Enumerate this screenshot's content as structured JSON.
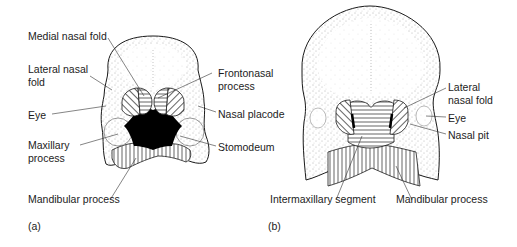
{
  "figure": {
    "panels": [
      {
        "id": "a",
        "tag": "(a)",
        "labels": {
          "medial_nasal_fold": "Medial nasal fold",
          "lateral_nasal_fold_line1": "Lateral nasal",
          "lateral_nasal_fold_line2": "fold",
          "eye": "Eye",
          "maxillary_process_line1": "Maxillary",
          "maxillary_process_line2": "process",
          "mandibular_process": "Mandibular process",
          "frontonasal_process_line1": "Frontonasal",
          "frontonasal_process_line2": "process",
          "nasal_placode": "Nasal placode",
          "stomodeum": "Stomodeum"
        }
      },
      {
        "id": "b",
        "tag": "(b)",
        "labels": {
          "lateral_nasal_fold_line1": "Lateral",
          "lateral_nasal_fold_line2": "nasal fold",
          "eye": "Eye",
          "nasal_pit": "Nasal pit",
          "intermaxillary_segment": "Intermaxillary segment",
          "mandibular_process": "Mandibular process"
        }
      }
    ],
    "colors": {
      "ink": "#1a1a1a",
      "stipple": "#6b6b6b",
      "background": "#ffffff"
    }
  }
}
